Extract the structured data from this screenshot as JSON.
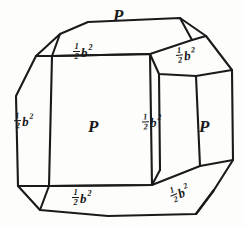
{
  "figure": {
    "ink_color": "#1a1a1a",
    "background_color": "#fdfdfb",
    "line_width": 2
  },
  "labels": {
    "top_face": {
      "symbol": "P",
      "kind": "letter"
    },
    "top_bevel": {
      "numerator": "1",
      "denominator": "2",
      "base": "b",
      "exponent": "2"
    },
    "top_right_bevel": {
      "numerator": "1",
      "denominator": "2",
      "base": "b",
      "exponent": "2"
    },
    "left_bevel": {
      "numerator": "1",
      "denominator": "2",
      "base": "b",
      "exponent": "2"
    },
    "front_face": {
      "symbol": "P",
      "kind": "letter"
    },
    "right_bevel": {
      "numerator": "1",
      "denominator": "2",
      "base": "b",
      "exponent": "2"
    },
    "right_face": {
      "symbol": "P",
      "kind": "letter"
    },
    "bottom_bevel": {
      "numerator": "1",
      "denominator": "2",
      "base": "b",
      "exponent": "2"
    },
    "bottom_right_bevel": {
      "numerator": "1",
      "denominator": "2",
      "base": "b",
      "exponent": "2"
    }
  },
  "geometry": {
    "outer_outline": "M 88,22 L 180,18 L 206,36 L 232,70 L 233,160 L 214,190 L 196,214 L 108,216 L 40,210 L 18,186 L 16,96 L 36,56 L 60,34 Z",
    "front_face_rect": "M 52,56 L 150,54 L 152,185 L 49,186 Z",
    "top_face": "M 52,56 L 150,54 L 192,40 L 180,18 L 88,22 L 60,34 Z",
    "top_left_bevel": "M 36,56 L 60,34 L 52,56 Z",
    "top_right_facet": "M 150,54 L 192,40 L 206,36 L 232,70 L 196,76 L 159,74 Z",
    "left_face": "M 16,96 L 36,56 L 52,56 L 49,186 L 40,210 L 18,186 Z",
    "right_face": "M 196,76 L 232,70 L 233,160 L 200,166 Z",
    "right_inner_col": "M 159,74 L 196,76 L 200,166 L 160,170 Z",
    "bottom_face": "M 49,186 L 152,185 L 160,170 L 200,166 L 196,214 L 108,216 L 40,210 Z",
    "bottom_right_facet": "M 152,185 L 200,166 L 233,160 L 214,190 L 196,214 Z",
    "bottom_left_bevel": "M 40,210 L 49,186 L 18,186 Z"
  }
}
